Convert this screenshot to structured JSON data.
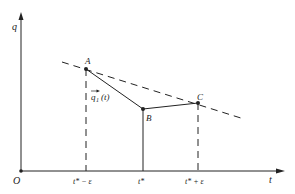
{
  "diagram": {
    "axes": {
      "y_label": "q",
      "x_label": "t",
      "origin_label": "O"
    },
    "points": {
      "A": {
        "label": "A",
        "x": 86,
        "y": 69
      },
      "B": {
        "label": "B",
        "x": 143,
        "y": 109
      },
      "C": {
        "label": "C",
        "x": 198,
        "y": 103
      }
    },
    "curve_label": "q⃗1(t)",
    "curve_label_main": "q",
    "curve_label_sub": "1",
    "curve_label_arg": "(t)",
    "tick_labels": {
      "t_minus": "t* − ε",
      "t_star": "t*",
      "t_plus": "t* + ε"
    },
    "colors": {
      "line": "#222222",
      "background": "#ffffff"
    }
  }
}
